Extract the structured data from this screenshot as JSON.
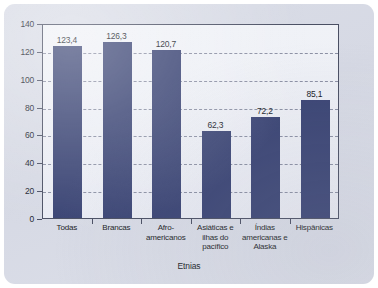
{
  "chart_data": {
    "type": "bar",
    "title": "",
    "subtitle": "",
    "xlabel": "Etnias",
    "ylabel": "",
    "ylim": [
      0,
      140
    ],
    "ytick_step": 20,
    "yticks": [
      "140",
      "120",
      "100",
      "80",
      "60",
      "40",
      "20",
      "0"
    ],
    "grid": true,
    "legend": false,
    "decimal_separator": ",",
    "categories": [
      "Todas",
      "Brancas",
      "Afro-\namericanos",
      "Asiáticas e\nilhas do\npacífico",
      "Índias\namericanas e\nAlaska",
      "Hispânicas"
    ],
    "category_lines": [
      [
        "Todas"
      ],
      [
        "Brancas"
      ],
      [
        "Afro-",
        "americanos"
      ],
      [
        "Asiáticas e",
        "ilhas do",
        "pacífico"
      ],
      [
        "Índias",
        "americanas e",
        "Alaska"
      ],
      [
        "Hispânicas"
      ]
    ],
    "values": [
      123.4,
      126.3,
      120.7,
      62.3,
      72.2,
      85.1
    ],
    "value_labels": [
      "123,4",
      "126,3",
      "120,7",
      "62,3",
      "72,2",
      "85,1"
    ],
    "colors": {
      "bar": "#3a4474",
      "plot_background": "#eef0f6",
      "card_background": "#d8dbe6",
      "axis": "#4a4f63",
      "gridline": "#7b8096",
      "text": "#1a1d26"
    }
  }
}
